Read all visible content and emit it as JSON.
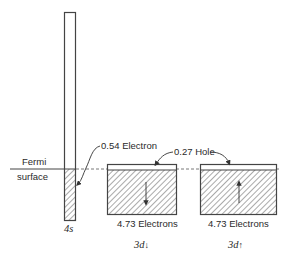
{
  "diagram": {
    "type": "band-filling diagram",
    "fermi_label_line1": "Fermi",
    "fermi_label_line2": "surface",
    "bands": [
      {
        "id": "4s",
        "label": "4s",
        "annotation": "0.54 Electron"
      },
      {
        "id": "3d-down",
        "label": "3d",
        "spin": "↓",
        "filled_label": "4.73 Electrons"
      },
      {
        "id": "3d-up",
        "label": "3d",
        "spin": "↑",
        "filled_label": "4.73 Electrons"
      }
    ],
    "hole_annotation": "0.27 Hole",
    "colors": {
      "line": "#4a4a4a",
      "hatch": "#555555",
      "background": "#ffffff"
    }
  }
}
